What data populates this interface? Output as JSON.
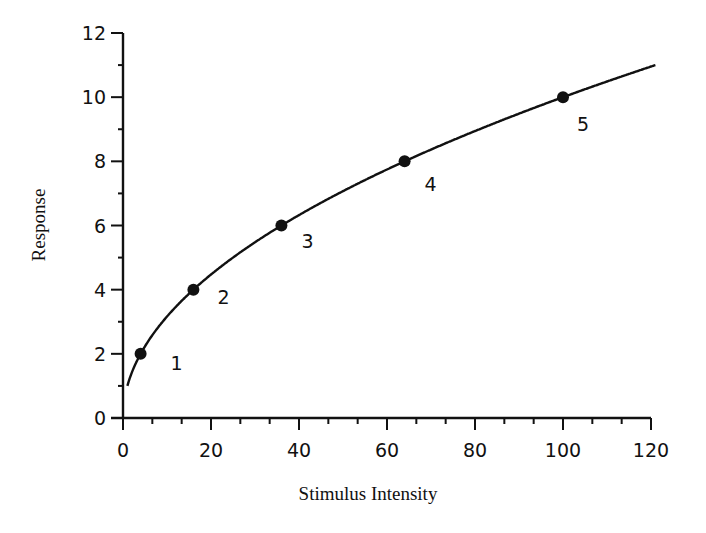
{
  "chart_data": {
    "type": "line",
    "title": "",
    "xlabel": "Stimulus Intensity",
    "ylabel": "Response",
    "xlim": [
      0,
      120
    ],
    "ylim": [
      0,
      12
    ],
    "x_ticks": [
      0,
      20,
      40,
      60,
      80,
      100,
      120
    ],
    "y_ticks": [
      0,
      2,
      4,
      6,
      8,
      10,
      12
    ],
    "x_tick_labels": [
      "0",
      "20",
      "40",
      "60",
      "80",
      "100",
      "120"
    ],
    "y_tick_labels": [
      "0",
      "2",
      "4",
      "6",
      "8",
      "10",
      "12"
    ],
    "grid": false,
    "legend": null,
    "curve": {
      "name": "Response = sqrt(Stimulus Intensity)",
      "function": "y = sqrt(x)",
      "x_start": 1,
      "x_end": 121
    },
    "series": [
      {
        "name": "Marked points",
        "x": [
          4,
          16,
          36,
          64,
          100
        ],
        "y": [
          2,
          4,
          6,
          8,
          10
        ],
        "labels": [
          "1",
          "2",
          "3",
          "4",
          "5"
        ]
      }
    ]
  }
}
